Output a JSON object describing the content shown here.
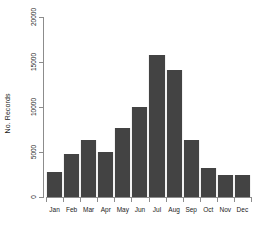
{
  "chart_data": {
    "type": "bar",
    "title": "",
    "xlabel": "",
    "ylabel": "No. Records",
    "categories": [
      "Jan",
      "Feb",
      "Mar",
      "Apr",
      "May",
      "Jun",
      "Jul",
      "Aug",
      "Sep",
      "Oct",
      "Nov",
      "Dec"
    ],
    "values": [
      2800,
      4800,
      6300,
      5000,
      7650,
      10000,
      15800,
      14100,
      6300,
      3200,
      2400,
      2500
    ],
    "ylim": [
      0,
      20000
    ],
    "yticks": [
      0,
      5000,
      10000,
      15000,
      20000
    ],
    "ytick_labels": [
      "0",
      "5000",
      "10000",
      "15000",
      "20000"
    ],
    "grid": false,
    "legend": false,
    "bar_color": "#434343",
    "axis_color": "#8c8c8c",
    "background": "#ffffff"
  },
  "axes": {
    "y_label_text": "No. Records"
  }
}
